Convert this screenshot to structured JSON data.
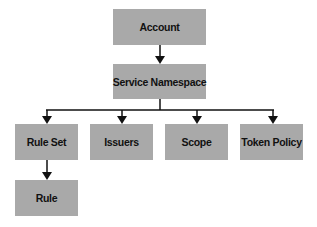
{
  "diagram": {
    "type": "hierarchy",
    "colors": {
      "box_fill": "#a9a9a9",
      "line": "#111111",
      "text": "#111111"
    },
    "nodes": {
      "account": {
        "label": "Account"
      },
      "service_namespace": {
        "label": "Service Namespace"
      },
      "rule_set": {
        "label": "Rule Set"
      },
      "issuers": {
        "label": "Issuers"
      },
      "scope": {
        "label": "Scope"
      },
      "token_policy": {
        "label": "Token Policy"
      },
      "rule": {
        "label": "Rule"
      }
    },
    "edges": [
      {
        "from": "Account",
        "to": "Service Namespace"
      },
      {
        "from": "Service Namespace",
        "to": "Rule Set"
      },
      {
        "from": "Service Namespace",
        "to": "Issuers"
      },
      {
        "from": "Service Namespace",
        "to": "Scope"
      },
      {
        "from": "Service Namespace",
        "to": "Token Policy"
      },
      {
        "from": "Rule Set",
        "to": "Rule"
      }
    ]
  }
}
